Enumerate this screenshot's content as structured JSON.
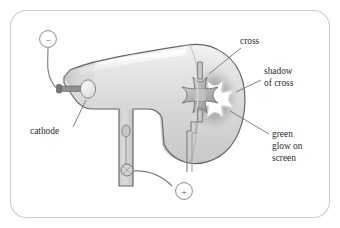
{
  "figure": {
    "frame": {
      "name": "figure-border",
      "stroke": "#c9c9c9",
      "fill": "#ffffff",
      "x": 10,
      "y": 10,
      "width": 320,
      "height": 208,
      "radius": 16
    },
    "colors": {
      "outline": "#5d5d5d",
      "tube_light": "#f1f1f1",
      "tube_mid": "#d8d8d8",
      "tube_dark": "#bdbdbd",
      "highlight": "#fbfbfb",
      "cross_fill": "#b5b5b5",
      "cross_stroke": "#6d6d6d",
      "electrode_fill": "#e2e2e2",
      "glow": "#9a9a9a",
      "shadow_fill": "#ffffff",
      "wire": "#6a6a6a",
      "text": "#2b2b2b"
    }
  },
  "labels": [
    {
      "id": "cross",
      "text": "cross",
      "x": 240,
      "y": 44,
      "anchor": "start"
    },
    {
      "id": "shadow-1",
      "text": "shadow",
      "x": 264,
      "y": 74,
      "anchor": "start"
    },
    {
      "id": "shadow-2",
      "text": "of cross",
      "x": 264,
      "y": 86,
      "anchor": "start"
    },
    {
      "id": "green-1",
      "text": "green",
      "x": 272,
      "y": 137,
      "anchor": "start"
    },
    {
      "id": "green-2",
      "text": "glow on",
      "x": 272,
      "y": 149,
      "anchor": "start"
    },
    {
      "id": "green-3",
      "text": "screen",
      "x": 272,
      "y": 161,
      "anchor": "start"
    },
    {
      "id": "cathode",
      "text": "cathode",
      "x": 30,
      "y": 134,
      "anchor": "start"
    }
  ],
  "terminals": [
    {
      "id": "negative",
      "symbol": "−",
      "name": "negative-terminal",
      "cx": 48,
      "cy": 39,
      "r": 8.5
    },
    {
      "id": "positive",
      "symbol": "+",
      "name": "positive-terminal",
      "cx": 184,
      "cy": 191,
      "r": 8.5
    }
  ],
  "leader_lines": [
    {
      "id": "cross-leader",
      "from": [
        238,
        48
      ],
      "to": [
        208,
        76
      ]
    },
    {
      "id": "shadow-leader",
      "from": [
        262,
        80
      ],
      "to": [
        238,
        92
      ]
    },
    {
      "id": "green-leader",
      "from": [
        270,
        135
      ],
      "to": [
        232,
        112
      ]
    },
    {
      "id": "cathode-leader",
      "from": [
        72,
        128
      ],
      "to": [
        84,
        102
      ]
    }
  ],
  "parts": {
    "envelope": "glass tube envelope",
    "cathode_disc": "cathode disc",
    "anode_stem": "anode stem",
    "maltese_cross": "maltese cross target",
    "screen_glow": "fluorescent screen glow",
    "cross_shadow": "shadow of cross on screen"
  }
}
